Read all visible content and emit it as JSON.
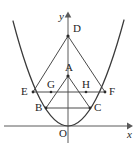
{
  "figure": {
    "kind": "geometry-diagram",
    "width": 138,
    "height": 153,
    "background_color": "#ffffff",
    "curve_color": "#3a3a3a",
    "segment_color": "#4a4a4a",
    "axis_color": "#5a5a5a",
    "label_color": "#1e1e1e"
  },
  "axes": {
    "x_label": "x",
    "y_label": "y",
    "origin_label": "O",
    "x_axis_y": 126,
    "y_axis_x": 68,
    "x_axis_start": 4,
    "x_axis_end": 130,
    "y_axis_top": 14,
    "y_axis_bottom": 143
  },
  "parabola": {
    "vertex": {
      "x": 68,
      "y": 126
    },
    "left_end": {
      "x": 13,
      "y": 21
    },
    "right_end": {
      "x": 124,
      "y": 20
    },
    "equation_hint": "y = a x^2 opening upward with vertex at origin"
  },
  "points": [
    {
      "name": "D",
      "label": "D",
      "x": 68,
      "y": 36,
      "label_dx": 5,
      "label_dy": -13,
      "dot": true
    },
    {
      "name": "A",
      "label": "A",
      "x": 68,
      "y": 76,
      "label_dx": -3,
      "label_dy": -14,
      "dot": true
    },
    {
      "name": "E",
      "label": "E",
      "x": 33,
      "y": 92,
      "label_dx": -12,
      "label_dy": -6,
      "dot": true
    },
    {
      "name": "F",
      "label": "F",
      "x": 105,
      "y": 92,
      "label_dx": 4,
      "label_dy": -6,
      "dot": true
    },
    {
      "name": "G",
      "label": "G",
      "x": 51,
      "y": 92,
      "label_dx": -4,
      "label_dy": -13,
      "dot": true
    },
    {
      "name": "H",
      "label": "H",
      "x": 86,
      "y": 92,
      "label_dx": -4,
      "label_dy": -13,
      "dot": true
    },
    {
      "name": "B",
      "label": "B",
      "x": 46,
      "y": 108,
      "label_dx": -11,
      "label_dy": -6,
      "dot": true
    },
    {
      "name": "C",
      "label": "C",
      "x": 90,
      "y": 108,
      "label_dx": 4,
      "label_dy": -6,
      "dot": true
    }
  ],
  "segments": [
    {
      "name": "segment-DE",
      "from": "D",
      "to": "E"
    },
    {
      "name": "segment-DF",
      "from": "D",
      "to": "F"
    },
    {
      "name": "segment-EF",
      "from": "E",
      "to": "F"
    },
    {
      "name": "segment-AB",
      "from": "A",
      "to": "B"
    },
    {
      "name": "segment-AC",
      "from": "A",
      "to": "C"
    },
    {
      "name": "segment-BC",
      "from": "B",
      "to": "C"
    }
  ],
  "triangles": [
    {
      "name": "triangle-DEF",
      "vertices": [
        "D",
        "E",
        "F"
      ]
    },
    {
      "name": "triangle-ABC",
      "vertices": [
        "A",
        "B",
        "C"
      ]
    }
  ]
}
